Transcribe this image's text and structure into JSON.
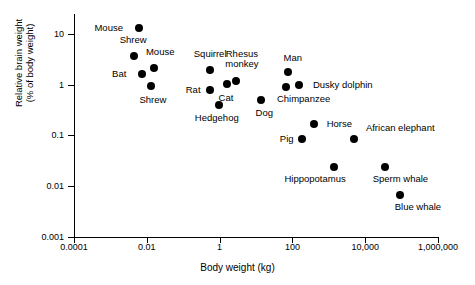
{
  "chart_data": {
    "type": "scatter",
    "title": "",
    "xlabel": "Body weight (kg)",
    "ylabel_line1": "Relative brain weight",
    "ylabel_line2": "(% of body weight)",
    "xscale": "log",
    "yscale": "log",
    "xlim": [
      0.0001,
      1000000
    ],
    "ylim": [
      0.001,
      20
    ],
    "grid": false,
    "legend": "none (points labelled directly)",
    "xticks": [
      "0.0001",
      "0.01",
      "1",
      "100",
      "10,000",
      "1,000,000"
    ],
    "xtick_values": [
      0.0001,
      0.01,
      1,
      100,
      10000,
      1000000
    ],
    "yticks": [
      "10",
      "1",
      "0.1",
      "0.01",
      "0.001"
    ],
    "ytick_values": [
      10,
      1,
      0.1,
      0.01,
      0.001
    ],
    "points": [
      {
        "label": "Mouse",
        "x": 0.006,
        "y": 13.0,
        "lx": -30,
        "ly": 0
      },
      {
        "label": "Shrew",
        "x": 0.0045,
        "y": 3.6,
        "lx": -1,
        "ly": -16
      },
      {
        "label": "Mouse",
        "x": 0.016,
        "y": 2.1,
        "lx": 6,
        "ly": -16
      },
      {
        "label": "Bat",
        "x": 0.0075,
        "y": 1.6,
        "lx": -23,
        "ly": 0
      },
      {
        "label": "Squirrel",
        "x": 0.55,
        "y": 1.9,
        "lx": 0,
        "ly": -16
      },
      {
        "label": "Shrew",
        "x": 0.013,
        "y": 0.95,
        "lx": 2,
        "ly": 14
      },
      {
        "label": "Rat",
        "x": 0.55,
        "y": 0.8,
        "lx": -17,
        "ly": 0
      },
      {
        "label": "Rhesus monkey",
        "x": 2.8,
        "y": 1.2,
        "lx": 6,
        "ly": -22
      },
      {
        "label": "Cat",
        "x": 1.6,
        "y": 1.05,
        "lx": -1,
        "ly": 14
      },
      {
        "label": "Man",
        "x": 75,
        "y": 1.8,
        "lx": 5,
        "ly": -14
      },
      {
        "label": "Dusky dolphin",
        "x": 150,
        "y": 1.0,
        "lx": 44,
        "ly": 0
      },
      {
        "label": "Chimpanzee",
        "x": 65,
        "y": 0.9,
        "lx": 18,
        "ly": 12
      },
      {
        "label": "Hedgehog",
        "x": 0.95,
        "y": 0.4,
        "lx": -2,
        "ly": 13
      },
      {
        "label": "Dog",
        "x": 14,
        "y": 0.5,
        "lx": 3,
        "ly": 13
      },
      {
        "label": "Horse",
        "x": 400,
        "y": 0.17,
        "lx": 25,
        "ly": 0
      },
      {
        "label": "Pig",
        "x": 180,
        "y": 0.085,
        "lx": -15,
        "ly": 0
      },
      {
        "label": "African elephant",
        "x": 5000,
        "y": 0.085,
        "lx": 46,
        "ly": -11
      },
      {
        "label": "Hippopotamus",
        "x": 1400,
        "y": 0.024,
        "lx": -19,
        "ly": 12
      },
      {
        "label": "Sperm whale",
        "x": 36000,
        "y": 0.024,
        "lx": 15,
        "ly": 12
      },
      {
        "label": "Blue whale",
        "x": 90000,
        "y": 0.0068,
        "lx": 18,
        "ly": 12
      }
    ]
  },
  "colors": {
    "point": "#000000",
    "axis": "#000000",
    "background": "#ffffff"
  }
}
